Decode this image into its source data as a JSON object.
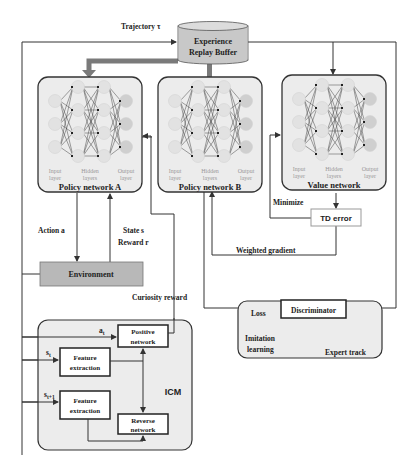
{
  "diagram": {
    "top_cut_text": "arrow",
    "buffer": {
      "line1": "Experience",
      "line2": "Replay Buffer",
      "fill": "#c8c8c8"
    },
    "trajectory_label": "Trajectory τ",
    "networks": [
      {
        "title": "Policy network A",
        "layer_labels": [
          [
            "Input",
            "layer"
          ],
          [
            "Hidden",
            "layers"
          ],
          [
            "Output",
            "layer"
          ]
        ]
      },
      {
        "title": "Policy network B",
        "layer_labels": [
          [
            "Input",
            "layer"
          ],
          [
            "Hidden",
            "layers"
          ],
          [
            "Output",
            "layer"
          ]
        ]
      },
      {
        "title": "Value network",
        "layer_labels": [
          [
            "Input",
            "layer"
          ],
          [
            "Hidden",
            "layers"
          ],
          [
            "Output",
            "layer"
          ]
        ]
      }
    ],
    "action_label": "Action a",
    "state_label": "State s",
    "reward_label": "Reward r",
    "environment_label": "Environment",
    "environment_fill": "#b8b8b8",
    "minimize_label": "Minimize",
    "td_error_label": "TD error",
    "weighted_gradient_label": "Weighted gradient",
    "curiosity_reward_label": "Curiosity reward",
    "icm": {
      "label": "ICM",
      "a_t": "a",
      "a_t_sub": "t",
      "s_t": "s",
      "s_t_sub": "t",
      "s_t1": "s",
      "s_t1_sub": "t+1",
      "positive_network": [
        "Positive",
        "network"
      ],
      "feature_extraction_1": [
        "Feature",
        "extraction"
      ],
      "feature_extraction_2": [
        "Feature",
        "extraction"
      ],
      "reverse_network": [
        "Reverse",
        "network"
      ]
    },
    "imitation": {
      "loss_label": "Loss",
      "discriminator_label": "Discriminator",
      "imitation_label": [
        "Imitation",
        "learning"
      ],
      "expert_track_label": "Expert track"
    },
    "colors": {
      "panel_fill": "#ececec",
      "node_light": "#e2e2e2",
      "node_dark": "#cfcfcf",
      "thick_arrow": "#7a7a7a",
      "td_border": "#999999"
    }
  }
}
